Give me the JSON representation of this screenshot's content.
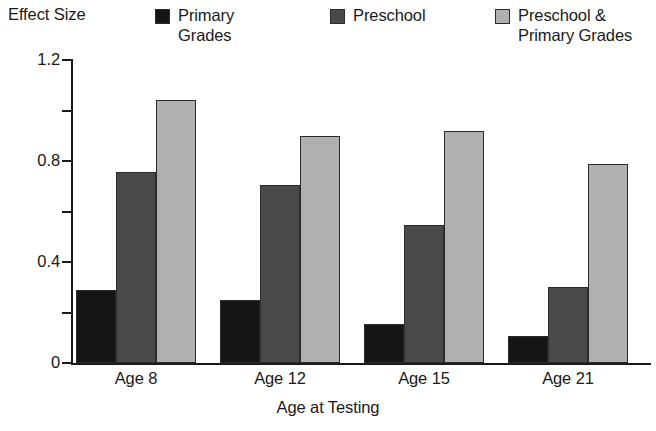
{
  "chart_data": {
    "type": "bar",
    "title": "",
    "xlabel": "Age at Testing",
    "ylabel": "Effect Size",
    "categories": [
      "Age 8",
      "Age 12",
      "Age 15",
      "Age 21"
    ],
    "series": [
      {
        "name": "Primary\nGrades",
        "color": "#151515",
        "values": [
          0.29,
          0.25,
          0.155,
          0.105
        ]
      },
      {
        "name": "Preschool",
        "color": "#4a4a4a",
        "values": [
          0.755,
          0.705,
          0.545,
          0.3
        ]
      },
      {
        "name": "Preschool &\nPrimary Grades",
        "color": "#b0b0b0",
        "values": [
          1.04,
          0.9,
          0.92,
          0.79
        ]
      }
    ],
    "ylim": [
      0,
      1.2
    ],
    "yticks": [
      0,
      0.4,
      0.8,
      1.2
    ],
    "ytick_labels": [
      "0",
      "0.4",
      "0.8",
      "1.2"
    ],
    "yminor_ticks": [
      0.2,
      0.6,
      1.0
    ],
    "grid": false,
    "legend_position": "top"
  },
  "legend": {
    "entries": [
      {
        "label": "Primary\nGrades"
      },
      {
        "label": "Preschool"
      },
      {
        "label": "Preschool &\nPrimary Grades"
      }
    ]
  },
  "axes": {
    "y_title": "Effect Size",
    "x_title": "Age at Testing",
    "y_tick_labels": [
      "1.2",
      "0.8",
      "0.4",
      "0"
    ],
    "x_tick_labels": [
      "Age 8",
      "Age 12",
      "Age 15",
      "Age 21"
    ]
  }
}
